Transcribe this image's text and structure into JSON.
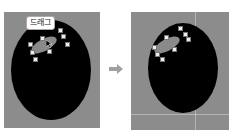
{
  "left_panel": {
    "tooltip_label": "드래그",
    "shape": "black-ellipse",
    "selection": "highlight-ellipse-with-handles"
  },
  "right_panel": {
    "shape": "black-ellipse",
    "selection": "highlight-ellipse-with-handles"
  },
  "arrow": {
    "icon": "arrow-right-icon",
    "color": "#a0a0a0"
  },
  "colors": {
    "canvas": "#8c8c8c",
    "shape": "#000000",
    "highlight": "#8a8a8a",
    "handle": "#eeeeee"
  }
}
